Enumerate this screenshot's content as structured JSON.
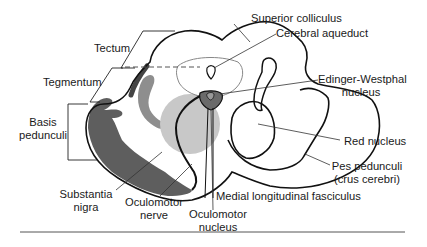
{
  "diagram": {
    "colors": {
      "outline": "#111111",
      "substantia_nigra": "#5e5e5e",
      "red_nucleus_fill": "#c8c8c8",
      "tract_fill": "#8e8e8e",
      "ew_nucleus_fill": "#6a6a6a",
      "leader_line": "#333333"
    },
    "labels": {
      "tectum": "Tectum",
      "tegmentum": "Tegmentum",
      "basis_line1": "Basis",
      "basis_line2": "pedunculi",
      "substantia_line1": "Substantia",
      "substantia_line2": "nigra",
      "oculomotor_nerve_line1": "Oculomotor",
      "oculomotor_nerve_line2": "nerve",
      "oculomotor_nucleus_line1": "Oculomotor",
      "oculomotor_nucleus_line2": "nucleus",
      "mlf": "Medial longitudinal fasciculus",
      "superior_colliculus": "Superior colliculus",
      "cerebral_aqueduct": "Cerebral aqueduct",
      "ew_line1": "Edinger-Westphal",
      "ew_line2": "nucleus",
      "red_nucleus": "Red nucleus",
      "pes_line1": "Pes pedunculi",
      "pes_line2": "(crus cerebri)"
    }
  }
}
